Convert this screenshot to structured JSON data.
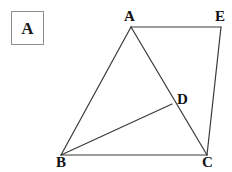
{
  "figure": {
    "panel": {
      "label": "A",
      "border_color": "#8d8d8d",
      "box": {
        "x": 11,
        "y": 11,
        "w": 33,
        "h": 34
      }
    },
    "stroke_color": "#3a3a3a",
    "stroke_width": 1.2,
    "background": "#ffffff",
    "width": 232,
    "height": 172,
    "vertices": [
      {
        "id": "A",
        "label": "A",
        "x": 131,
        "y": 27,
        "label_x": 124,
        "label_y": 9
      },
      {
        "id": "E",
        "label": "E",
        "x": 221,
        "y": 27,
        "label_x": 215,
        "label_y": 9
      },
      {
        "id": "D",
        "label": "D",
        "x": 172,
        "y": 104,
        "label_x": 177,
        "label_y": 92
      },
      {
        "id": "B",
        "label": "B",
        "x": 61,
        "y": 155,
        "label_x": 56,
        "label_y": 155
      },
      {
        "id": "C",
        "label": "C",
        "x": 207,
        "y": 155,
        "label_x": 202,
        "label_y": 155
      }
    ],
    "segments": [
      {
        "id": "A-E",
        "from": "A",
        "to": "E",
        "x1": 131,
        "y1": 27,
        "x2": 221,
        "y2": 27
      },
      {
        "id": "A-B",
        "from": "A",
        "to": "B",
        "x1": 131,
        "y1": 27,
        "x2": 61,
        "y2": 155
      },
      {
        "id": "A-C",
        "from": "A",
        "to": "C",
        "x1": 131,
        "y1": 27,
        "x2": 207,
        "y2": 155
      },
      {
        "id": "E-C",
        "from": "E",
        "to": "C",
        "x1": 221,
        "y1": 27,
        "x2": 207,
        "y2": 155
      },
      {
        "id": "B-C",
        "from": "B",
        "to": "C",
        "x1": 61,
        "y1": 155,
        "x2": 207,
        "y2": 155
      },
      {
        "id": "B-D",
        "from": "B",
        "to": "D",
        "x1": 61,
        "y1": 155,
        "x2": 172,
        "y2": 104
      }
    ]
  }
}
